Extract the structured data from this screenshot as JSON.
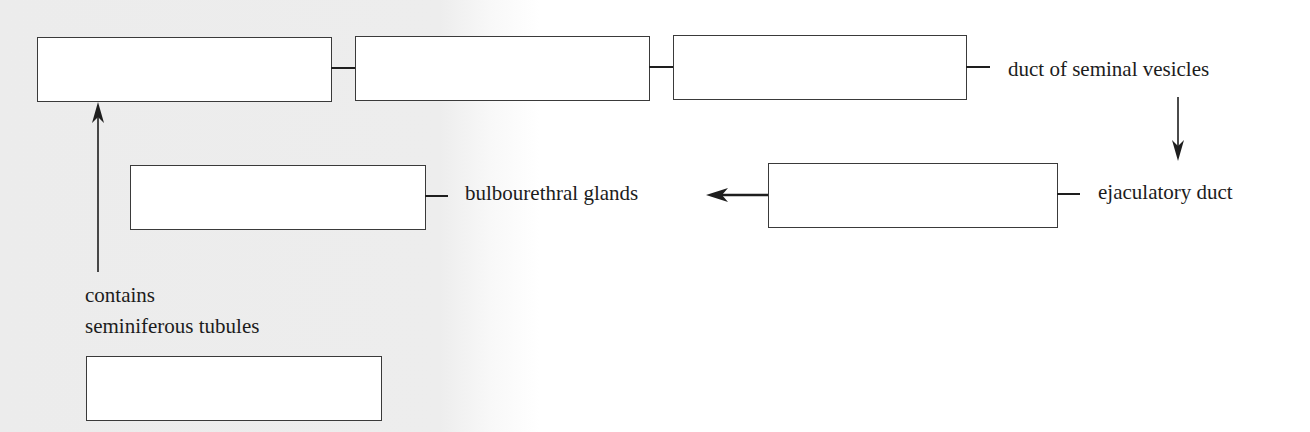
{
  "diagram": {
    "type": "fill-in-the-blank flow diagram",
    "boxes": [
      {
        "id": "box-1",
        "value": "",
        "row": 1,
        "order": 1
      },
      {
        "id": "box-2",
        "value": "",
        "row": 1,
        "order": 2
      },
      {
        "id": "box-3",
        "value": "",
        "row": 1,
        "order": 3
      },
      {
        "id": "box-4",
        "value": "",
        "row": 2,
        "order": 5
      },
      {
        "id": "box-5",
        "value": "",
        "row": 2,
        "order": 4
      },
      {
        "id": "box-6",
        "value": "",
        "row": 3,
        "order": 0
      }
    ],
    "labels": {
      "duct_of_seminal_vesicles": "duct of seminal vesicles",
      "bulbourethral_glands": "bulbourethral glands",
      "ejaculatory_duct": "ejaculatory duct",
      "contains_line1": "contains",
      "contains_line2": "seminiferous tubules"
    },
    "connections": [
      {
        "from": "box-1",
        "to": "box-2",
        "kind": "line"
      },
      {
        "from": "box-2",
        "to": "box-3",
        "kind": "line"
      },
      {
        "from": "box-3",
        "to": "duct of seminal vesicles",
        "kind": "line"
      },
      {
        "from": "duct of seminal vesicles",
        "to": "ejaculatory duct",
        "kind": "arrow-down"
      },
      {
        "from": "ejaculatory duct",
        "to": "box-5",
        "kind": "line"
      },
      {
        "from": "box-5",
        "to": "bulbourethral glands",
        "kind": "arrow-left"
      },
      {
        "from": "box-4",
        "to": "bulbourethral glands",
        "kind": "line"
      },
      {
        "from": "contains seminiferous tubules",
        "to": "box-1",
        "kind": "arrow-up"
      }
    ],
    "colors": {
      "stroke": "#1e1e1e",
      "box_fill": "#ffffff",
      "background_left": "#ececec",
      "background_right": "#ffffff"
    }
  }
}
